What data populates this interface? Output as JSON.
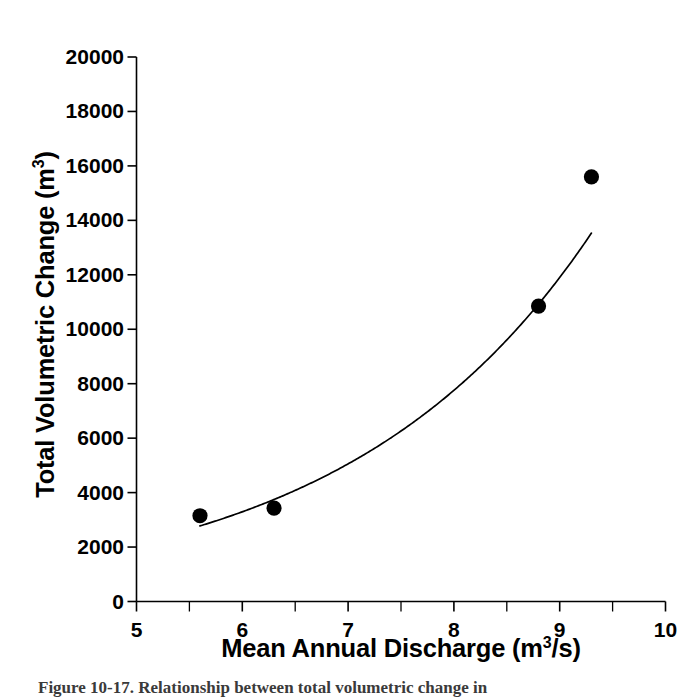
{
  "figure": {
    "background_color": "#ffffff",
    "ink_color": "#000000"
  },
  "axes": {
    "x": {
      "title_main": "Mean Annual Discharge (m",
      "title_sup": "3",
      "title_tail": "/s)",
      "title_full": "Mean Annual Discharge (m3/s)",
      "tick_labels": [
        "5",
        "6",
        "7",
        "8",
        "9",
        "10"
      ],
      "tick_values": [
        5,
        6,
        7,
        8,
        9,
        10
      ],
      "minor_tick_values": [
        5.5,
        6.5,
        7.5,
        8.5,
        9.5
      ],
      "range": [
        5,
        10
      ]
    },
    "y": {
      "title_main": "Total Volumetric Change (m",
      "title_sup": "3",
      "title_tail": ")",
      "title_full": "Total Volumetric Change (m3)",
      "tick_labels": [
        "0",
        "2000",
        "4000",
        "6000",
        "8000",
        "10000",
        "12000",
        "14000",
        "16000",
        "18000",
        "20000"
      ],
      "tick_values": [
        0,
        2000,
        4000,
        6000,
        8000,
        10000,
        12000,
        14000,
        16000,
        18000,
        20000
      ],
      "range": [
        0,
        20000
      ]
    }
  },
  "caption": {
    "text": "Figure 10-17.  Relationship between total volumetric change in"
  },
  "chart_data": {
    "type": "scatter",
    "title": "",
    "xlabel": "Mean Annual Discharge (m3/s)",
    "ylabel": "Total Volumetric Change (m3)",
    "xlim": [
      5,
      10
    ],
    "ylim": [
      0,
      20000
    ],
    "grid": false,
    "legend": "none",
    "x": [
      5.6,
      6.3,
      8.8,
      9.3
    ],
    "y": [
      3150,
      3430,
      10850,
      15600
    ],
    "points": [
      {
        "x": 5.6,
        "y": 3150
      },
      {
        "x": 6.3,
        "y": 3430
      },
      {
        "x": 8.8,
        "y": 10850
      },
      {
        "x": 9.3,
        "y": 15600
      }
    ],
    "marker": "filled-circle",
    "marker_color": "#000000",
    "fit_curve": {
      "name": "exponential trend line",
      "color": "#000000",
      "x_start": 5.6,
      "x_end": 9.3,
      "y_start": 2850,
      "y_end": 14400,
      "samples": [
        {
          "x": 5.6,
          "y": 2850
        },
        {
          "x": 6.0,
          "y": 3350
        },
        {
          "x": 6.5,
          "y": 4080
        },
        {
          "x": 7.0,
          "y": 4980
        },
        {
          "x": 7.5,
          "y": 6080
        },
        {
          "x": 8.0,
          "y": 7500
        },
        {
          "x": 8.5,
          "y": 9350
        },
        {
          "x": 9.0,
          "y": 11900
        },
        {
          "x": 9.3,
          "y": 14400
        }
      ]
    }
  }
}
